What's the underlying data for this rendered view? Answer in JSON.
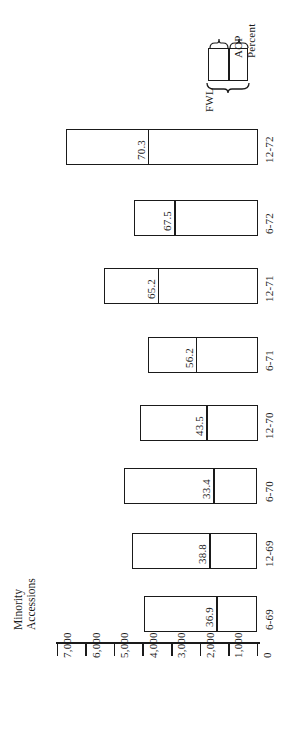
{
  "chart_data": {
    "type": "bar",
    "orientation": "horizontal-rotated",
    "title": "",
    "xlabel": "",
    "ylabel": "Minority Accessions",
    "ylabel_lines": [
      "Minority",
      "Accessions"
    ],
    "axis": {
      "min": 0,
      "max": 7000,
      "tick_interval": 1000,
      "tick_labels": [
        "7,000",
        "6,000",
        "5,000",
        "4,000",
        "3,000",
        "2,000",
        "1,000",
        "0"
      ],
      "tick_values": [
        7000,
        6000,
        5000,
        4000,
        3000,
        2000,
        1000,
        0
      ],
      "grid": false
    },
    "categories": [
      "12-72",
      "6-72",
      "12-71",
      "6-71",
      "12-70",
      "6-70",
      "12-69",
      "6-69"
    ],
    "series": [
      {
        "name": "FWL",
        "description": "Full bar length (FWL goal, minority accessions)",
        "values": [
          6720,
          4340,
          5390,
          3850,
          4130,
          4660,
          4380,
          3960
        ]
      },
      {
        "name": "AOP",
        "description": "Segment from 0 to split (AOP actual accessions)",
        "values": [
          3850,
          2930,
          3500,
          2170,
          1800,
          1560,
          1700,
          1460
        ]
      }
    ],
    "data_labels": {
      "name": "Percent",
      "values": [
        "70.3",
        "67.5",
        "65.2",
        "56.2",
        "43.5",
        "33.4",
        "38.8",
        "36.9"
      ],
      "numeric": [
        70.3,
        67.5,
        65.2,
        56.2,
        43.5,
        33.4,
        38.8,
        36.9
      ]
    },
    "bars": [
      {
        "category": "12-72",
        "percent": "70.3",
        "total": 6720,
        "aop": 3850
      },
      {
        "category": "6-72",
        "percent": "67.5",
        "total": 4340,
        "aop": 2930
      },
      {
        "category": "12-71",
        "percent": "65.2",
        "total": 5390,
        "aop": 3500
      },
      {
        "category": "6-71",
        "percent": "56.2",
        "total": 3850,
        "aop": 2170
      },
      {
        "category": "12-70",
        "percent": "43.5",
        "total": 4130,
        "aop": 1800
      },
      {
        "category": "6-70",
        "percent": "33.4",
        "total": 4660,
        "aop": 1560
      },
      {
        "category": "12-69",
        "percent": "38.8",
        "total": 4380,
        "aop": 1700
      },
      {
        "category": "6-69",
        "percent": "36.9",
        "total": 3960,
        "aop": 1460
      }
    ],
    "legend": {
      "position": "top-right",
      "entries": [
        {
          "label": "FWL",
          "description": "whole box"
        },
        {
          "label": "AOP",
          "description": "left segment"
        },
        {
          "label": "Percent",
          "description": "value at split"
        }
      ],
      "fwl_label": "AOP",
      "aop_label": "AOP",
      "percent_label": "Percent",
      "outer_label": "FWL"
    },
    "colors": {
      "ink": "#1a1a1a",
      "background": "#ffffff",
      "bar_fill": "#ffffff",
      "bar_stroke": "#1a1a1a"
    }
  }
}
